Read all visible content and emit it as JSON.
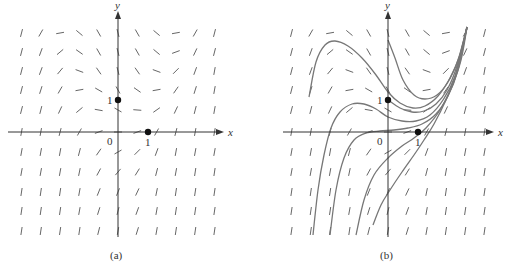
{
  "chart_data": [
    {
      "type": "direction_field",
      "panel_label": "(a)",
      "xlabel": "x",
      "ylabel": "y",
      "origin_label": "0",
      "tick_labels": {
        "x_one": "1",
        "y_one": "1"
      },
      "points": [
        {
          "x": 0,
          "y": 1
        },
        {
          "x": 1,
          "y": 0
        }
      ],
      "grid": {
        "cols": 11,
        "rows": 11,
        "spacing_px": 19.3
      },
      "slope_angles_deg_rows_top_to_bottom": [
        [
          75,
          60,
          10,
          -40,
          -60,
          -75,
          -60,
          -40,
          10,
          60,
          75
        ],
        [
          75,
          70,
          40,
          -35,
          -60,
          -75,
          -60,
          -40,
          20,
          65,
          75
        ],
        [
          75,
          70,
          50,
          -20,
          -55,
          -75,
          -55,
          -20,
          45,
          70,
          80
        ],
        [
          75,
          72,
          60,
          10,
          -30,
          -60,
          -35,
          10,
          55,
          72,
          80
        ],
        [
          75,
          75,
          65,
          40,
          -10,
          -30,
          -5,
          35,
          65,
          75,
          80
        ],
        [
          80,
          80,
          75,
          60,
          20,
          0,
          20,
          60,
          75,
          80,
          80
        ],
        [
          80,
          80,
          80,
          75,
          55,
          30,
          45,
          70,
          80,
          80,
          80
        ],
        [
          80,
          80,
          80,
          78,
          62,
          50,
          58,
          75,
          80,
          82,
          82
        ],
        [
          82,
          82,
          82,
          80,
          68,
          68,
          65,
          78,
          82,
          82,
          82
        ],
        [
          82,
          82,
          82,
          80,
          72,
          75,
          70,
          80,
          82,
          82,
          82
        ],
        [
          82,
          82,
          82,
          82,
          75,
          80,
          72,
          80,
          82,
          82,
          82
        ]
      ]
    },
    {
      "type": "direction_field_with_solution_curves",
      "panel_label": "(b)",
      "xlabel": "x",
      "ylabel": "y",
      "origin_label": "0",
      "tick_labels": {
        "x_one": "1",
        "y_one": "1"
      },
      "points": [
        {
          "x": 0,
          "y": 1
        },
        {
          "x": 1,
          "y": 0
        }
      ],
      "solution_curves_px": [
        [
          [
            309,
            97
          ],
          [
            316,
            62
          ],
          [
            325,
            45
          ],
          [
            335,
            41
          ],
          [
            348,
            46
          ],
          [
            362,
            58
          ],
          [
            376,
            75
          ],
          [
            388,
            92
          ],
          [
            400,
            103
          ],
          [
            413,
            108
          ],
          [
            425,
            106
          ],
          [
            438,
            96
          ],
          [
            450,
            78
          ],
          [
            460,
            55
          ],
          [
            467,
            27
          ]
        ],
        [
          [
            388,
            40
          ],
          [
            395,
            58
          ],
          [
            403,
            80
          ],
          [
            414,
            95
          ],
          [
            425,
            99
          ],
          [
            437,
            95
          ],
          [
            448,
            82
          ],
          [
            458,
            60
          ],
          [
            467,
            27
          ]
        ],
        [
          [
            388,
            100
          ],
          [
            400,
            108
          ],
          [
            412,
            112
          ],
          [
            424,
            111
          ],
          [
            436,
            104
          ],
          [
            447,
            90
          ],
          [
            457,
            66
          ],
          [
            467,
            27
          ]
        ],
        [
          [
            313,
            235
          ],
          [
            318,
            190
          ],
          [
            324,
            155
          ],
          [
            331,
            128
          ],
          [
            340,
            112
          ],
          [
            352,
            104
          ],
          [
            364,
            104
          ],
          [
            376,
            109
          ],
          [
            388,
            117
          ],
          [
            402,
            121
          ],
          [
            416,
            121
          ],
          [
            430,
            115
          ],
          [
            443,
            100
          ],
          [
            455,
            76
          ],
          [
            467,
            27
          ]
        ],
        [
          [
            330,
            235
          ],
          [
            336,
            190
          ],
          [
            344,
            158
          ],
          [
            354,
            140
          ],
          [
            366,
            133
          ],
          [
            380,
            131
          ],
          [
            394,
            130
          ],
          [
            408,
            128
          ],
          [
            422,
            124
          ],
          [
            436,
            114
          ],
          [
            448,
            96
          ],
          [
            458,
            70
          ],
          [
            467,
            27
          ]
        ],
        [
          [
            356,
            235
          ],
          [
            364,
            200
          ],
          [
            374,
            175
          ],
          [
            388,
            158
          ],
          [
            402,
            146
          ],
          [
            414,
            138
          ],
          [
            426,
            128
          ],
          [
            440,
            110
          ],
          [
            452,
            86
          ],
          [
            461,
            60
          ],
          [
            467,
            27
          ]
        ],
        [
          [
            373,
            225
          ],
          [
            381,
            205
          ],
          [
            390,
            190
          ],
          [
            402,
            172
          ],
          [
            414,
            155
          ],
          [
            424,
            140
          ],
          [
            434,
            124
          ],
          [
            446,
            100
          ],
          [
            456,
            75
          ],
          [
            467,
            27
          ]
        ]
      ],
      "grid": {
        "cols": 11,
        "rows": 11,
        "spacing_px": 19.3
      },
      "slope_angles_deg_rows_top_to_bottom": [
        [
          75,
          60,
          10,
          -40,
          -60,
          -75,
          -60,
          -40,
          10,
          60,
          75
        ],
        [
          75,
          70,
          40,
          -35,
          -60,
          -75,
          -60,
          -40,
          20,
          65,
          75
        ],
        [
          75,
          70,
          50,
          -20,
          -55,
          -75,
          -55,
          -20,
          45,
          70,
          80
        ],
        [
          75,
          72,
          60,
          10,
          -30,
          -60,
          -35,
          10,
          55,
          72,
          80
        ],
        [
          75,
          75,
          65,
          40,
          -10,
          -30,
          -5,
          35,
          65,
          75,
          80
        ],
        [
          80,
          80,
          75,
          60,
          20,
          0,
          20,
          60,
          75,
          80,
          80
        ],
        [
          80,
          80,
          80,
          75,
          55,
          30,
          45,
          70,
          80,
          80,
          80
        ],
        [
          80,
          80,
          80,
          78,
          62,
          50,
          58,
          75,
          80,
          82,
          82
        ],
        [
          82,
          82,
          82,
          80,
          68,
          68,
          65,
          78,
          82,
          82,
          82
        ],
        [
          82,
          82,
          82,
          80,
          72,
          75,
          70,
          80,
          82,
          82,
          82
        ],
        [
          82,
          82,
          82,
          82,
          75,
          80,
          72,
          80,
          82,
          82,
          82
        ]
      ]
    }
  ],
  "panels": {
    "a": {
      "label": "(a)",
      "x_axis": "x",
      "y_axis": "y",
      "origin": "0",
      "x_one": "1",
      "y_one": "1"
    },
    "b": {
      "label": "(b)",
      "x_axis": "x",
      "y_axis": "y",
      "origin": "0",
      "x_one": "1",
      "y_one": "1"
    }
  },
  "colors": {
    "field": "#555555",
    "axes": "#333333",
    "curves": "#777777",
    "points": "#111111"
  }
}
